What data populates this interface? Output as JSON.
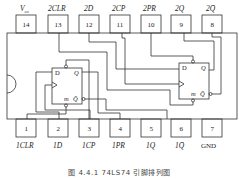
{
  "diagram": {
    "caption": "图 4.4.1  74LS74 引脚排列图",
    "caption_note": "Only '图' and a figure number are legible at this resolution; the remaining characters are an unconfirmed guess.",
    "top_pins": [
      {
        "num": "14",
        "label": "V",
        "sub": "cc"
      },
      {
        "num": "13",
        "label": "2CLR",
        "sub": ""
      },
      {
        "num": "12",
        "label": "2D",
        "sub": ""
      },
      {
        "num": "11",
        "label": "2CP",
        "sub": ""
      },
      {
        "num": "10",
        "label": "2PR",
        "sub": ""
      },
      {
        "num": "9",
        "label": "2Q",
        "sub": ""
      },
      {
        "num": "8",
        "label": "2Q̄",
        "sub": ""
      }
    ],
    "bottom_pins": [
      {
        "num": "1",
        "label": "1CLR"
      },
      {
        "num": "2",
        "label": "1D"
      },
      {
        "num": "3",
        "label": "1CP"
      },
      {
        "num": "4",
        "label": "1PR"
      },
      {
        "num": "5",
        "label": "1Q"
      },
      {
        "num": "6",
        "label": "1Q̄"
      },
      {
        "num": "7",
        "label": "GND"
      }
    ],
    "flipflops": [
      {
        "name": "FF1",
        "d": "D",
        "q": "Q",
        "m": "m",
        "qbar": "Q̄"
      },
      {
        "name": "FF2",
        "d": "D",
        "q": "Q",
        "m": "m",
        "qbar": "Q̄"
      }
    ]
  }
}
